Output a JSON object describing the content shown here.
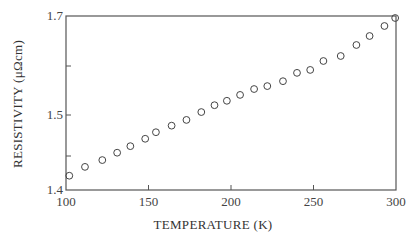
{
  "chart_data": {
    "type": "scatter",
    "title": "",
    "xlabel": "TEMPERATURE (K)",
    "ylabel": "RESISTIVITY (μΩcm)",
    "xlim": [
      100,
      300
    ],
    "ylim": [
      1.4,
      1.7
    ],
    "grid": false,
    "legend": null,
    "x_ticks": [
      100,
      150,
      200,
      250,
      300
    ],
    "y_ticks": [
      {
        "value": 1.4,
        "label": "1.4"
      },
      {
        "value": 1.45,
        "label": ""
      },
      {
        "value": 1.5,
        "label": "1.5"
      },
      {
        "value": 1.6,
        "label": ""
      },
      {
        "value": 1.7,
        "label": "1.7"
      }
    ],
    "series": [
      {
        "name": "resistivity",
        "marker": "open-circle",
        "x": [
          102,
          111.5,
          122,
          131,
          139,
          148,
          154.5,
          164,
          173,
          182,
          190,
          197.5,
          205.5,
          214,
          222,
          231.5,
          240,
          248,
          256,
          266.5,
          276,
          284,
          293,
          299.5
        ],
        "y": [
          1.421,
          1.434,
          1.444,
          1.454,
          1.462,
          1.471,
          1.479,
          1.487,
          1.494,
          1.506,
          1.52,
          1.529,
          1.541,
          1.553,
          1.559,
          1.569,
          1.586,
          1.592,
          1.61,
          1.62,
          1.642,
          1.66,
          1.68,
          1.696
        ]
      }
    ]
  },
  "layout": {
    "plot": {
      "left": 66,
      "right": 396,
      "top": 16,
      "bottom": 190
    },
    "y_pixel_map": [
      [
        1.4,
        190
      ],
      [
        1.45,
        156
      ],
      [
        1.5,
        115
      ],
      [
        1.6,
        66
      ],
      [
        1.7,
        16
      ]
    ],
    "colors": {
      "axis": "#555555",
      "marker": "#444444",
      "text": "#333333"
    }
  }
}
